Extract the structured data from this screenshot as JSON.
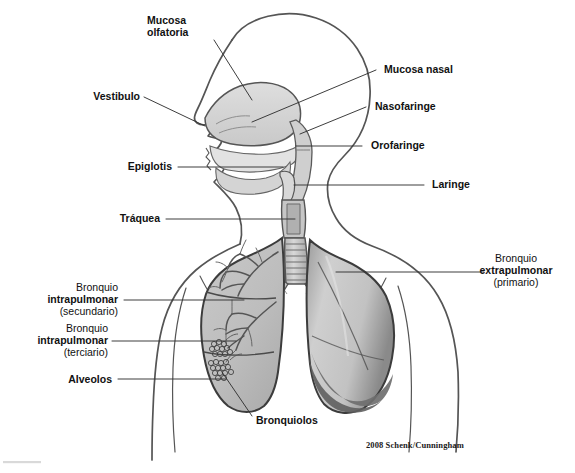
{
  "figure": {
    "credit": "2008 Schenk/Cunningham",
    "colors": {
      "outline": "#4a4a4a",
      "text": "#111111",
      "leader": "#3a3a3a",
      "cavity_fill": "#d6d6d6",
      "lung_left_fill": "#bdbdbd",
      "lung_right_light": "#c9c9c9",
      "lung_right_dark": "#6f6f6f",
      "trachea_fill": "#c4c4c4",
      "footer_rule": "#d9d9d9",
      "background": "#ffffff"
    }
  },
  "labels": {
    "mucosa_olfatoria": {
      "lines": [
        "Mucosa",
        "olfatoria"
      ],
      "bold": [
        true,
        true
      ],
      "align": "left"
    },
    "vestibulo": {
      "lines": [
        "Vestibulo"
      ],
      "bold": [
        true
      ],
      "align": "left"
    },
    "epiglotis": {
      "lines": [
        "Epiglotis"
      ],
      "bold": [
        true
      ],
      "align": "left"
    },
    "traquea": {
      "lines": [
        "Tráquea"
      ],
      "bold": [
        true
      ],
      "align": "left"
    },
    "mucosa_nasal": {
      "lines": [
        "Mucosa nasal"
      ],
      "bold": [
        true
      ],
      "align": "left"
    },
    "nasofaringe": {
      "lines": [
        "Nasofaringe"
      ],
      "bold": [
        true
      ],
      "align": "left"
    },
    "orofaringe": {
      "lines": [
        "Orofaringe"
      ],
      "bold": [
        true
      ],
      "align": "left"
    },
    "laringe": {
      "lines": [
        "Laringe"
      ],
      "bold": [
        true
      ],
      "align": "left"
    },
    "bronquio_extrapulmonar": {
      "lines": [
        "Bronquio",
        "extrapulmonar",
        "(primario)"
      ],
      "bold": [
        false,
        true,
        false
      ],
      "align": "center"
    },
    "bronquio_secundario": {
      "lines": [
        "Bronquio",
        "intrapulmonar",
        "(secundario)"
      ],
      "bold": [
        false,
        true,
        false
      ],
      "align": "right"
    },
    "bronquio_terciario": {
      "lines": [
        "Bronquio",
        "intrapulmonar",
        "(terciario)"
      ],
      "bold": [
        false,
        true,
        false
      ],
      "align": "right"
    },
    "alveolos": {
      "lines": [
        "Alveolos"
      ],
      "bold": [
        true
      ],
      "align": "right"
    },
    "bronquiolos": {
      "lines": [
        "Bronquiolos"
      ],
      "bold": [
        true
      ],
      "align": "left"
    }
  }
}
